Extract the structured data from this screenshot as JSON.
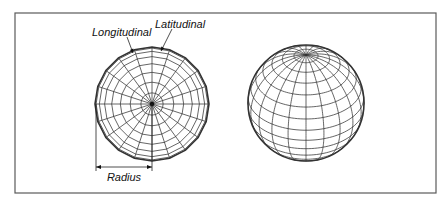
{
  "figure": {
    "frame": {
      "x": 15,
      "y": 13,
      "width": 421,
      "height": 180,
      "color": "#5a5a5a"
    },
    "labels": {
      "longitudinal": "Longitudinal",
      "latitudinal": "Latitudinal",
      "radius": "Radius"
    },
    "flat_sphere": {
      "description": "Top-down (polar) view of a sphere mesh",
      "center": [
        152,
        104
      ],
      "radius": 57,
      "segments": 20,
      "rings": 8,
      "stroke": "#333333"
    },
    "perspective_sphere": {
      "description": "Tilted 3D wireframe sphere",
      "center": [
        306,
        103
      ],
      "radius": 58,
      "meridians": 20,
      "parallel_step_deg": 12,
      "tilt_deg": 34,
      "stroke": "#333333"
    },
    "annotations": {
      "longitudinal_leader": {
        "from": [
          127,
          37
        ],
        "to": [
          133,
          53
        ]
      },
      "latitudinal_leader": {
        "from": [
          172,
          29
        ],
        "to": [
          161,
          51
        ]
      },
      "radius_dimension": {
        "x1": 96,
        "x2": 152,
        "y": 167,
        "ext_top": 104,
        "ext_bottom": 171
      }
    }
  }
}
